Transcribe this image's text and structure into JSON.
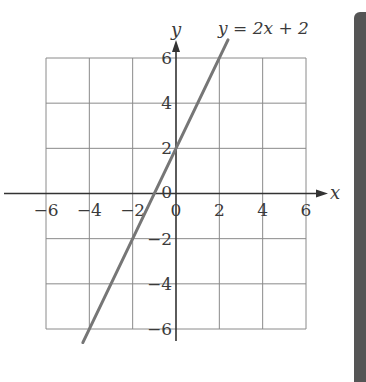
{
  "chart_data": {
    "type": "line",
    "title": "",
    "xlabel": "x",
    "ylabel": "y",
    "xlim": [
      -6,
      6
    ],
    "ylim": [
      -6,
      6
    ],
    "grid": true,
    "x_ticks": [
      -6,
      -4,
      -2,
      0,
      2,
      4,
      6
    ],
    "y_ticks": [
      -6,
      -4,
      -2,
      2,
      4,
      6
    ],
    "x_tick_labels": [
      "−6",
      "−4",
      "−2",
      "0",
      "2",
      "4",
      "6"
    ],
    "y_tick_labels": [
      "−6",
      "−4",
      "−2",
      "2",
      "4",
      "6"
    ],
    "origin_label": "0",
    "series": [
      {
        "name": "y = 2x + 2",
        "equation": {
          "slope": 2,
          "intercept": 2
        },
        "x": [
          -4.3,
          2.4
        ],
        "y": [
          -6.6,
          6.8
        ],
        "color": "#767676"
      }
    ],
    "annotations": [
      {
        "text": "y = 2x + 2",
        "position": "top-right near line end"
      }
    ]
  },
  "labels": {
    "x_axis": "x",
    "y_axis": "y",
    "equation": "y = 2x + 2"
  },
  "colors": {
    "grid": "#8a8a8a",
    "axis": "#333333",
    "line": "#767676",
    "side_bar": "#555555"
  }
}
